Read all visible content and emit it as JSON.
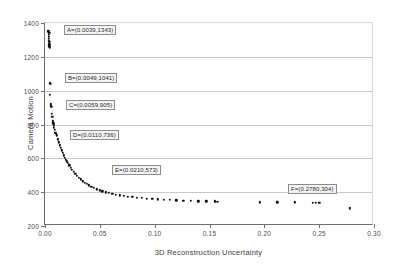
{
  "chart_data": {
    "type": "scatter",
    "title": "",
    "xlabel": "3D Reconstruction Uncertainty",
    "ylabel": "Camera Motion",
    "xlim": [
      0.0,
      0.3
    ],
    "ylim": [
      200,
      1400
    ],
    "grid": true,
    "legend": null,
    "xticks": [
      "0.00",
      "0.05",
      "0.10",
      "0.15",
      "0.20",
      "0.25",
      "0.30"
    ],
    "xtick_values": [
      0.0,
      0.05,
      0.1,
      0.15,
      0.2,
      0.25,
      0.3
    ],
    "yticks": [
      "200",
      "400",
      "600",
      "800",
      "1000",
      "1200",
      "1400"
    ],
    "ytick_values": [
      200,
      400,
      600,
      800,
      1000,
      1200,
      1400
    ],
    "marker": "dot",
    "marker_color": "#111111",
    "points": [
      [
        0.0031,
        1352
      ],
      [
        0.0033,
        1343
      ],
      [
        0.0034,
        1330
      ],
      [
        0.0035,
        1318
      ],
      [
        0.0036,
        1305
      ],
      [
        0.0037,
        1296
      ],
      [
        0.0038,
        1288
      ],
      [
        0.0039,
        1343
      ],
      [
        0.004,
        1275
      ],
      [
        0.0041,
        1262
      ],
      [
        0.0042,
        1255
      ],
      [
        0.0044,
        1045
      ],
      [
        0.0046,
        975
      ],
      [
        0.0049,
        1041
      ],
      [
        0.0052,
        920
      ],
      [
        0.0055,
        912
      ],
      [
        0.0059,
        905
      ],
      [
        0.0062,
        862
      ],
      [
        0.0065,
        845
      ],
      [
        0.007,
        820
      ],
      [
        0.0074,
        806
      ],
      [
        0.0078,
        795
      ],
      [
        0.0083,
        780
      ],
      [
        0.0088,
        768
      ],
      [
        0.0094,
        752
      ],
      [
        0.0101,
        744
      ],
      [
        0.011,
        736
      ],
      [
        0.0118,
        712
      ],
      [
        0.0126,
        695
      ],
      [
        0.0134,
        678
      ],
      [
        0.0142,
        662
      ],
      [
        0.0151,
        648
      ],
      [
        0.016,
        632
      ],
      [
        0.017,
        618
      ],
      [
        0.0181,
        604
      ],
      [
        0.0192,
        592
      ],
      [
        0.0201,
        582
      ],
      [
        0.021,
        573
      ],
      [
        0.0222,
        558
      ],
      [
        0.0234,
        545
      ],
      [
        0.0247,
        532
      ],
      [
        0.0261,
        520
      ],
      [
        0.0276,
        508
      ],
      [
        0.0291,
        497
      ],
      [
        0.0307,
        486
      ],
      [
        0.0324,
        475
      ],
      [
        0.0342,
        465
      ],
      [
        0.0361,
        456
      ],
      [
        0.0381,
        448
      ],
      [
        0.0402,
        440
      ],
      [
        0.0424,
        432
      ],
      [
        0.0447,
        425
      ],
      [
        0.0471,
        418
      ],
      [
        0.0497,
        412
      ],
      [
        0.0524,
        406
      ],
      [
        0.0552,
        400
      ],
      [
        0.0582,
        395
      ],
      [
        0.0613,
        390
      ],
      [
        0.0646,
        386
      ],
      [
        0.0681,
        382
      ],
      [
        0.0717,
        378
      ],
      [
        0.0755,
        374
      ],
      [
        0.0795,
        371
      ],
      [
        0.0837,
        368
      ],
      [
        0.0881,
        365
      ],
      [
        0.0928,
        362
      ],
      [
        0.0977,
        360
      ],
      [
        0.1028,
        358
      ],
      [
        0.1082,
        356
      ],
      [
        0.1139,
        354
      ],
      [
        0.1199,
        352
      ],
      [
        0.1262,
        350
      ],
      [
        0.1328,
        349
      ],
      [
        0.1398,
        347
      ],
      [
        0.1471,
        346
      ],
      [
        0.1548,
        345
      ],
      [
        0.156,
        344
      ],
      [
        0.1575,
        343
      ],
      [
        0.196,
        341
      ],
      [
        0.212,
        340
      ],
      [
        0.228,
        339
      ],
      [
        0.244,
        338
      ],
      [
        0.247,
        337
      ],
      [
        0.25,
        337
      ],
      [
        0.278,
        304
      ]
    ],
    "annotations": [
      {
        "id": "A",
        "text": "A=(0.0039,1343)",
        "x": 0.0039,
        "y": 1343,
        "box_left_px": 64,
        "box_top_px": 25
      },
      {
        "id": "B",
        "text": "B=(0.0049,1041)",
        "x": 0.0049,
        "y": 1041,
        "box_left_px": 65,
        "box_top_px": 73
      },
      {
        "id": "C",
        "text": "C=(0.0059,905)",
        "x": 0.0059,
        "y": 905,
        "box_left_px": 66,
        "box_top_px": 100
      },
      {
        "id": "D",
        "text": "D=(0.0110,736)",
        "x": 0.011,
        "y": 736,
        "box_left_px": 70,
        "box_top_px": 130
      },
      {
        "id": "E",
        "text": "E=(0.0210,573)",
        "x": 0.021,
        "y": 573,
        "box_left_px": 112,
        "box_top_px": 165
      },
      {
        "id": "F",
        "text": "F=(0.2780,304)",
        "x": 0.278,
        "y": 304,
        "box_left_px": 288,
        "box_top_px": 184
      }
    ]
  }
}
